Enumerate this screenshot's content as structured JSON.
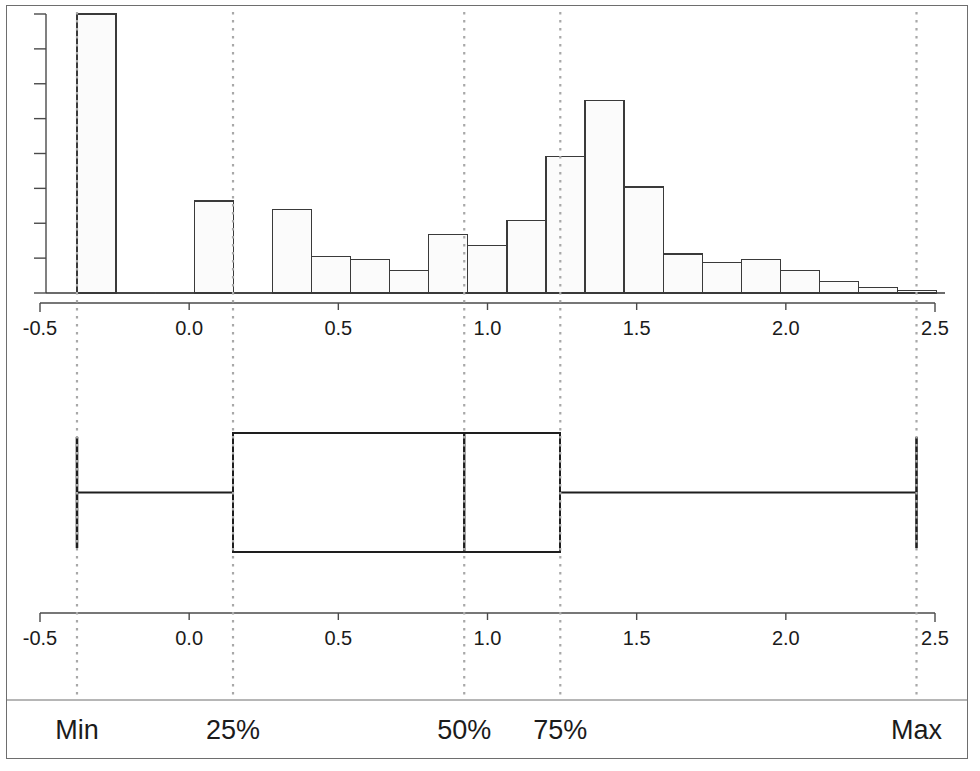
{
  "figure": {
    "background_color": "#ffffff",
    "frame_color": "#6e6e6e",
    "bar_fill_color": "#fbfbfb",
    "bar_stroke_color": "#3a3a3a",
    "axis_color": "#4a4a4a",
    "guide_line_color": "#a8a8a8",
    "box_stroke_color": "#1e1e1e"
  },
  "chart_data": [
    {
      "type": "bar",
      "id": "histogram",
      "title": "",
      "subtitle": "",
      "xlabel": "",
      "ylabel": "",
      "xlim": [
        -0.5,
        2.5
      ],
      "ylim": [
        0,
        1.0
      ],
      "grid": false,
      "legend": null,
      "xticks": [
        -0.5,
        0.0,
        0.5,
        1.0,
        1.5,
        2.0,
        2.5
      ],
      "xtick_labels": [
        "-0.5",
        "0.0",
        "0.5",
        "1.0",
        "1.5",
        "2.0",
        "2.5"
      ],
      "ytick_labels": [],
      "ytick_count": 8,
      "bin_width": 0.131,
      "bin_left_edges": [
        -0.376,
        -0.245,
        -0.114,
        0.017,
        0.148,
        0.279,
        0.41,
        0.541,
        0.672,
        0.803,
        0.934,
        1.065,
        1.196,
        1.327,
        1.458,
        1.589,
        1.72,
        1.851,
        1.982,
        2.113,
        2.244,
        2.375
      ],
      "categories": [
        "-0.38",
        "-0.25",
        "-0.11",
        "0.02",
        "0.15",
        "0.28",
        "0.41",
        "0.54",
        "0.67",
        "0.80",
        "0.93",
        "1.07",
        "1.20",
        "1.33",
        "1.46",
        "1.59",
        "1.72",
        "1.85",
        "1.98",
        "2.11",
        "2.24",
        "2.38"
      ],
      "values": [
        1.0,
        0.0,
        0.0,
        0.33,
        0.0,
        0.3,
        0.13,
        0.12,
        0.08,
        0.21,
        0.17,
        0.26,
        0.49,
        0.69,
        0.38,
        0.14,
        0.11,
        0.12,
        0.08,
        0.04,
        0.02,
        0.01
      ]
    },
    {
      "type": "boxplot",
      "id": "box-plot",
      "title": "",
      "xlabel": "",
      "xlim": [
        -0.5,
        2.5
      ],
      "xticks": [
        -0.5,
        0.0,
        0.5,
        1.0,
        1.5,
        2.0,
        2.5
      ],
      "xtick_labels": [
        "-0.5",
        "0.0",
        "0.5",
        "1.0",
        "1.5",
        "2.0",
        "2.5"
      ],
      "orientation": "horizontal",
      "statistics": {
        "min": -0.376,
        "q1": 0.147,
        "median": 0.922,
        "q3": 1.244,
        "max": 2.438
      }
    }
  ],
  "histogram_axis": {
    "tick_labels": [
      "-0.5",
      "0.0",
      "0.5",
      "1.0",
      "1.5",
      "2.0",
      "2.5"
    ]
  },
  "boxplot_axis": {
    "tick_labels": [
      "-0.5",
      "0.0",
      "0.5",
      "1.0",
      "1.5",
      "2.0",
      "2.5"
    ]
  },
  "quartile_guides": {
    "labels": [
      "Min",
      "25%",
      "50%",
      "75%",
      "Max"
    ],
    "values": [
      -0.376,
      0.147,
      0.922,
      1.244,
      2.438
    ]
  }
}
